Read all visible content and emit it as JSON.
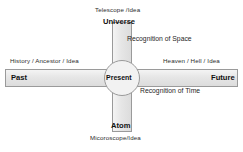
{
  "diagram": {
    "background_color": "#ffffff",
    "bar_fill_color": "#e8e8e8",
    "bar_stroke_color": "#9a9a9a",
    "text_color": "#222222",
    "axes": {
      "horizontal": {
        "name": "Recognition of Time",
        "left_end_label": "Past",
        "center_label": "Present",
        "right_end_label": "Future",
        "left_annotation": "History / Ancestor / Idea",
        "right_annotation": "Heaven / Hell / Idea",
        "axis_caption": "Recognition of Time"
      },
      "vertical": {
        "name": "Recognition of Space",
        "top_end_label": "Universe",
        "center_label": "Present",
        "bottom_end_label": "Atom",
        "top_annotation": "Telescope /Idea",
        "bottom_annotation": "Micoroscope/Idea",
        "axis_caption": "Recognition of Space"
      }
    },
    "center_node": {
      "label": "Present",
      "shape": "circle"
    }
  }
}
